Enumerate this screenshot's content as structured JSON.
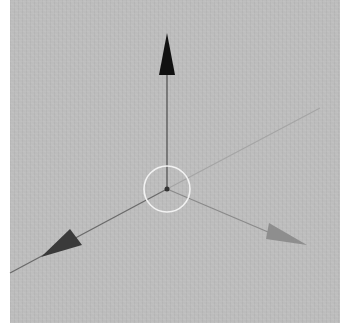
{
  "scene": {
    "background_color": "#bcbcbc",
    "page_background": "#ffffff",
    "viewport": {
      "x": 10,
      "y": 0,
      "width": 330,
      "height": 323
    }
  },
  "gizmo": {
    "center": {
      "x": 167,
      "y": 189
    },
    "ring": {
      "radius": 23,
      "color": "#f2f2f2"
    },
    "center_dot": {
      "radius": 2.5,
      "color": "#333333"
    },
    "axes": [
      {
        "name": "up-axis",
        "direction": "up",
        "line_color": "#555555",
        "cone_color": "#111111",
        "line_end": {
          "x": 167,
          "y": 75
        },
        "cone_tip": {
          "x": 167,
          "y": 33
        },
        "cone_base_left": {
          "x": 159,
          "y": 75
        },
        "cone_base_right": {
          "x": 175,
          "y": 75
        }
      },
      {
        "name": "lower-left-axis",
        "direction": "lower-left",
        "line_color": "#6a6a6a",
        "cone_color": "#3a3a3a",
        "line_end": {
          "x": 10,
          "y": 273
        },
        "cone_tip": {
          "x": 41,
          "y": 257
        },
        "cone_base_a": {
          "x": 70,
          "y": 229
        },
        "cone_base_b": {
          "x": 82,
          "y": 245
        }
      },
      {
        "name": "lower-right-axis",
        "direction": "lower-right",
        "line_color": "#8a8a8a",
        "cone_color": "#8e8e8e",
        "line_end": {
          "x": 268,
          "y": 232
        },
        "cone_tip": {
          "x": 307,
          "y": 245
        },
        "cone_base_a": {
          "x": 269,
          "y": 223
        },
        "cone_base_b": {
          "x": 266,
          "y": 239
        }
      },
      {
        "name": "upper-right-axis",
        "direction": "upper-right",
        "line_color": "#a5a5a5",
        "cone_color": null,
        "line_end": {
          "x": 320,
          "y": 108
        }
      }
    ]
  }
}
